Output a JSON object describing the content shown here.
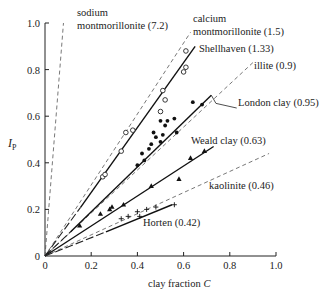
{
  "chart_data": {
    "type": "scatter",
    "title": "",
    "xlabel": "clay fraction C",
    "ylabel": "I_P",
    "xlim": [
      0,
      1.0
    ],
    "ylim": [
      0,
      1.0
    ],
    "grid": false,
    "x_ticks": [
      "0",
      "0.2",
      "0.4",
      "0.6",
      "0.8",
      "1.0"
    ],
    "y_ticks": [
      "0",
      "0.2",
      "0.4",
      "0.6",
      "0.8",
      "1.0"
    ],
    "lines": [
      {
        "name": "sodium montmorillonite (7.2)",
        "style": "dashed",
        "from": [
          0,
          0
        ],
        "to": [
          0.08,
          1.0
        ]
      },
      {
        "name": "calcium montmorillonite (1.5)",
        "style": "dashed",
        "from": [
          0,
          0
        ],
        "to": [
          0.63,
          0.96
        ]
      },
      {
        "name": "Shellhaven (1.33)",
        "style": "solid",
        "from": [
          0.07,
          0.07
        ],
        "to": [
          0.65,
          0.9
        ],
        "extension": "long-dash"
      },
      {
        "name": "illite (0.9)",
        "style": "dashed",
        "from": [
          0,
          0
        ],
        "to": [
          0.9,
          0.83
        ]
      },
      {
        "name": "London clay (0.95)",
        "style": "solid",
        "from": [
          0.05,
          0.05
        ],
        "to": [
          0.72,
          0.69
        ],
        "extension": "long-dash"
      },
      {
        "name": "Weald clay (0.63)",
        "style": "solid",
        "from": [
          0,
          0
        ],
        "to": [
          0.73,
          0.47
        ]
      },
      {
        "name": "kaolinite (0.46)",
        "style": "dashed",
        "from": [
          0,
          0
        ],
        "to": [
          0.97,
          0.44
        ]
      },
      {
        "name": "Horten (0.42)",
        "style": "solid",
        "from": [
          0.12,
          0.06
        ],
        "to": [
          0.55,
          0.22
        ],
        "extension": "long-dash"
      }
    ],
    "series": [
      {
        "name": "Shellhaven",
        "marker": "open-circle",
        "points": [
          [
            0.25,
            0.34
          ],
          [
            0.26,
            0.35
          ],
          [
            0.33,
            0.45
          ],
          [
            0.35,
            0.53
          ],
          [
            0.38,
            0.54
          ],
          [
            0.5,
            0.62
          ],
          [
            0.52,
            0.67
          ],
          [
            0.51,
            0.71
          ],
          [
            0.6,
            0.79
          ],
          [
            0.61,
            0.81
          ],
          [
            0.61,
            0.88
          ]
        ]
      },
      {
        "name": "London clay",
        "marker": "filled-circle",
        "points": [
          [
            0.4,
            0.39
          ],
          [
            0.42,
            0.44
          ],
          [
            0.43,
            0.41
          ],
          [
            0.45,
            0.46
          ],
          [
            0.46,
            0.48
          ],
          [
            0.48,
            0.51
          ],
          [
            0.5,
            0.49
          ],
          [
            0.51,
            0.52
          ],
          [
            0.52,
            0.56
          ],
          [
            0.53,
            0.58
          ],
          [
            0.47,
            0.53
          ],
          [
            0.5,
            0.58
          ],
          [
            0.56,
            0.59
          ],
          [
            0.64,
            0.66
          ],
          [
            0.68,
            0.65
          ],
          [
            0.57,
            0.53
          ]
        ]
      },
      {
        "name": "Weald clay",
        "marker": "filled-triangle",
        "points": [
          [
            0.15,
            0.13
          ],
          [
            0.24,
            0.18
          ],
          [
            0.28,
            0.2
          ],
          [
            0.29,
            0.21
          ],
          [
            0.34,
            0.22
          ],
          [
            0.46,
            0.3
          ],
          [
            0.58,
            0.33
          ],
          [
            0.63,
            0.42
          ],
          [
            0.69,
            0.45
          ]
        ]
      },
      {
        "name": "Horten",
        "marker": "plus",
        "points": [
          [
            0.33,
            0.16
          ],
          [
            0.36,
            0.17
          ],
          [
            0.4,
            0.19
          ],
          [
            0.41,
            0.17
          ],
          [
            0.44,
            0.2
          ],
          [
            0.48,
            0.21
          ],
          [
            0.56,
            0.22
          ]
        ]
      }
    ],
    "annotations": [
      {
        "text": "sodium",
        "x_px": 77,
        "y_px": 16
      },
      {
        "text": "montmorillonite (7.2)",
        "x_px": 77,
        "y_px": 29
      },
      {
        "text": "calcium",
        "x_px": 193,
        "y_px": 22
      },
      {
        "text": "montmorillonite (1.5)",
        "x_px": 193,
        "y_px": 35
      },
      {
        "text": "Shellhaven (1.33)",
        "x_px": 199,
        "y_px": 52
      },
      {
        "text": "illite (0.9)",
        "x_px": 254,
        "y_px": 69
      },
      {
        "text": "London clay (0.95)",
        "x_px": 238,
        "y_px": 106
      },
      {
        "text": "Weald clay (0.63)",
        "x_px": 191,
        "y_px": 144
      },
      {
        "text": "kaolinite (0.46)",
        "x_px": 209,
        "y_px": 189
      },
      {
        "text": "Horten (0.42)",
        "x_px": 143,
        "y_px": 226
      }
    ]
  }
}
